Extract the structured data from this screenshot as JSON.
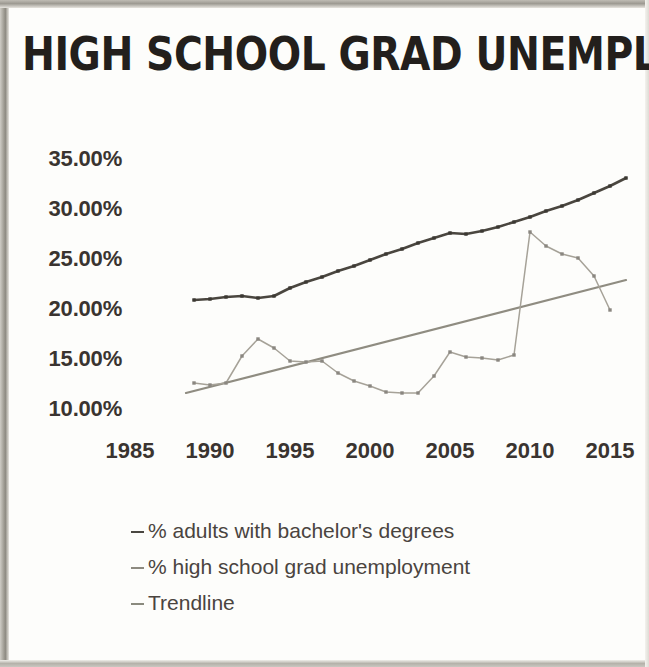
{
  "title": "HIGH SCHOOL GRAD UNEMPLOYMENT",
  "axes": {
    "y_ticks": [
      "35.00%",
      "30.00%",
      "25.00%",
      "20.00%",
      "15.00%",
      "10.00%"
    ],
    "x_ticks": [
      "1985",
      "1990",
      "1995",
      "2000",
      "2005",
      "2010",
      "2015"
    ]
  },
  "legend": {
    "items": [
      {
        "label": "% adults with bachelor's degrees",
        "color": "#4a4741",
        "marker": "dash-marker"
      },
      {
        "label": "% high school grad unemployment",
        "color": "#8d8a80",
        "marker": "dash-marker"
      },
      {
        "label": "Trendline",
        "color": "#8a8a7e",
        "marker": "dash-marker"
      }
    ]
  },
  "colors": {
    "bachelors": "#4a463f",
    "unemployment": "#a6a298",
    "trendline": "#8f8c81",
    "text": "#3a3430",
    "background": "#fdfdfb"
  },
  "chart_data": {
    "type": "line",
    "title": "HIGH SCHOOL GRAD UNEMPLOYMENT",
    "xlabel": "",
    "ylabel": "",
    "xlim": [
      1985,
      2016
    ],
    "ylim": [
      10,
      35
    ],
    "grid": false,
    "legend_position": "below-plot-left",
    "y_tick_values": [
      35,
      30,
      25,
      20,
      15,
      10
    ],
    "x_tick_values": [
      1985,
      1990,
      1995,
      2000,
      2005,
      2010,
      2015
    ],
    "series": [
      {
        "name": "% adults with bachelor's degrees",
        "color": "#4a463f",
        "x": [
          1989,
          1990,
          1991,
          1992,
          1993,
          1994,
          1995,
          1996,
          1997,
          1998,
          1999,
          2000,
          2001,
          2002,
          2003,
          2004,
          2005,
          2006,
          2007,
          2008,
          2009,
          2010,
          2011,
          2012,
          2013,
          2014,
          2015,
          2016
        ],
        "values": [
          21.0,
          21.1,
          21.3,
          21.4,
          21.2,
          21.4,
          22.2,
          22.8,
          23.3,
          23.9,
          24.4,
          25.0,
          25.6,
          26.1,
          26.7,
          27.2,
          27.7,
          27.6,
          27.9,
          28.3,
          28.8,
          29.3,
          29.9,
          30.4,
          31.0,
          31.7,
          32.4,
          33.2
        ]
      },
      {
        "name": "% high school grad unemployment",
        "color": "#a6a298",
        "x": [
          1989,
          1990,
          1991,
          1992,
          1993,
          1994,
          1995,
          1996,
          1997,
          1998,
          1999,
          2000,
          2001,
          2002,
          2003,
          2004,
          2005,
          2006,
          2007,
          2008,
          2009,
          2010,
          2011,
          2012,
          2013,
          2014,
          2015
        ],
        "values": [
          12.7,
          12.5,
          12.7,
          15.4,
          17.1,
          16.2,
          14.9,
          14.8,
          14.9,
          13.7,
          12.9,
          12.4,
          11.8,
          11.7,
          11.7,
          13.4,
          15.8,
          15.3,
          15.2,
          15.0,
          15.5,
          27.8,
          26.4,
          25.6,
          25.2,
          23.4,
          20.0
        ]
      },
      {
        "name": "Trendline",
        "color": "#8f8c81",
        "type": "trend",
        "x": [
          1988.5,
          2016
        ],
        "values": [
          11.7,
          23.0
        ]
      }
    ]
  }
}
